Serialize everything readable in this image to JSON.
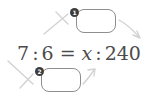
{
  "exercise": {
    "type": "proportion-cross-multiplication",
    "equation": {
      "left_antecedent": "7",
      "left_ratio_separator": ":",
      "left_consequent": "6",
      "equals_sign": "=",
      "right_antecedent": "x",
      "right_ratio_separator": ":",
      "right_consequent": "240"
    },
    "answer_slots": [
      {
        "id": "top",
        "badge": "1",
        "value": "",
        "placeholder": ""
      },
      {
        "id": "bottom",
        "badge": "2",
        "value": "",
        "placeholder": ""
      }
    ],
    "annotations": {
      "cross_top_icon": "cross-multiply-x-icon",
      "cross_bottom_icon": "cross-multiply-x-icon",
      "arrow_top_right_icon": "arrow-down-right-icon",
      "arrow_bottom_right_icon": "arrow-up-right-icon"
    }
  },
  "colors": {
    "text": "#4b4b4b",
    "box_border": "#8e8e8e",
    "annotation": "#cfcfcf",
    "badge_background": "#3c3c3c",
    "badge_text": "#ffffff",
    "page_background": "#ffffff"
  }
}
